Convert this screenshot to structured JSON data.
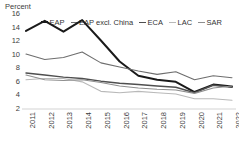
{
  "axis": {
    "unit_label": "Percent",
    "y_ticks": [
      16,
      14,
      12,
      10,
      8,
      6,
      4,
      2
    ],
    "x_ticks": [
      "2011",
      "2012",
      "2013",
      "2014",
      "2015",
      "2016",
      "2017",
      "2018",
      "2019",
      "2020",
      "2021",
      "2022"
    ]
  },
  "legend": {
    "position": "top",
    "items": [
      {
        "label": "EAP",
        "color": "#1a1a1a"
      },
      {
        "label": "EAP excl. China",
        "color": "#6e6e6e"
      },
      {
        "label": "ECA",
        "color": "#4f4f4f"
      },
      {
        "label": "LAC",
        "color": "#b9b9b9"
      },
      {
        "label": "SAR",
        "color": "#8f8f8f"
      }
    ]
  },
  "chart_data": {
    "type": "line",
    "title": "",
    "subtitle": "",
    "xlabel": "",
    "ylabel": "Percent",
    "xlim": [
      2011,
      2022
    ],
    "ylim": [
      2,
      16
    ],
    "y_tick_step": 2,
    "grid": false,
    "legend_position": "top",
    "x": [
      "2011",
      "2012",
      "2013",
      "2014",
      "2015",
      "2016",
      "2017",
      "2018",
      "2019",
      "2020",
      "2021",
      "2022"
    ],
    "categories": [
      "2011",
      "2012",
      "2013",
      "2014",
      "2015",
      "2016",
      "2017",
      "2018",
      "2019",
      "2020",
      "2021",
      "2022"
    ],
    "series": [
      {
        "name": "EAP",
        "color": "#1a1a1a",
        "width": 2.0,
        "values": [
          13.5,
          15.0,
          13.4,
          15.1,
          12.1,
          9.0,
          6.9,
          6.3,
          6.0,
          4.5,
          5.6,
          5.3
        ]
      },
      {
        "name": "EAP excl. China",
        "color": "#6e6e6e",
        "width": 1.1,
        "values": [
          10.1,
          9.3,
          9.6,
          10.4,
          8.8,
          8.2,
          7.6,
          7.1,
          7.5,
          6.3,
          6.9,
          6.6
        ]
      },
      {
        "name": "ECA",
        "color": "#4f4f4f",
        "width": 1.4,
        "values": [
          7.3,
          7.0,
          6.7,
          6.5,
          6.1,
          5.8,
          5.6,
          5.4,
          5.2,
          4.4,
          5.5,
          5.2
        ]
      },
      {
        "name": "LAC",
        "color": "#b9b9b9",
        "width": 1.1,
        "values": [
          6.3,
          6.5,
          6.5,
          6.0,
          4.6,
          4.4,
          4.6,
          4.4,
          4.2,
          3.5,
          3.5,
          3.3
        ]
      },
      {
        "name": "SAR",
        "color": "#8f8f8f",
        "width": 1.1,
        "values": [
          7.0,
          6.3,
          6.2,
          6.3,
          5.9,
          5.4,
          5.1,
          4.9,
          4.8,
          4.3,
          5.1,
          5.4
        ]
      }
    ]
  }
}
